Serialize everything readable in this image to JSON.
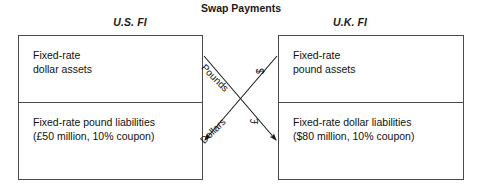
{
  "diagram": {
    "center_heading": "Swap\nPayments",
    "left": {
      "title": "U.S. FI",
      "assets": "Fixed-rate\ndollar assets",
      "liabilities": "Fixed-rate pound liabilities\n(£50 million, 10% coupon)"
    },
    "right": {
      "title": "U.K. FI",
      "assets": "Fixed-rate\npound assets",
      "liabilities": "Fixed-rate dollar liabilities\n($80 million, 10% coupon)"
    },
    "flows": [
      {
        "label": "Pounds",
        "from": "U.S. FI",
        "to": "U.K. FI"
      },
      {
        "label": "Dollars",
        "from": "U.K. FI",
        "to": "U.S. FI"
      },
      {
        "label": "$",
        "from": "U.K. FI",
        "to": "U.S. FI"
      },
      {
        "label": "£",
        "from": "U.S. FI",
        "to": "U.K. FI"
      }
    ],
    "colors": {
      "border": "#4a4a4a",
      "text": "#111111",
      "background": "#ffffff",
      "arrow": "#1a1a1a"
    }
  }
}
